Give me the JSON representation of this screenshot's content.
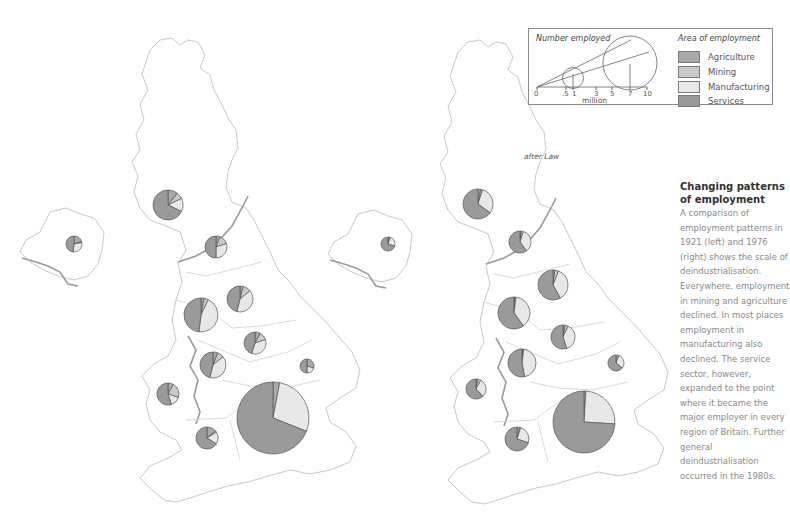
{
  "legend": {
    "number_title": "Number employed",
    "scale_ticks": [
      "0",
      ".5",
      "1",
      "3",
      "5",
      "7",
      "10"
    ],
    "scale_unit": "million",
    "area_title": "Area of employment",
    "items": [
      {
        "label": "Agriculture",
        "color": "#a9a9a9"
      },
      {
        "label": "Mining",
        "color": "#c9c9c9"
      },
      {
        "label": "Manufacturing",
        "color": "#e6e6e6"
      },
      {
        "label": "Services",
        "color": "#9a9a9a"
      }
    ]
  },
  "source_note": "after Law",
  "caption": {
    "title": "Changing patterns of employment",
    "body": "A comparison of employment patterns in 1921 (left) and 1976 (right) shows the scale of deindustrialisation. Everywhere, employment in mining and agriculture declined. In most places employment in manufacturing also declined. The service sector, however, expanded to the point where it became the major employer in every region of Britain. Further general deindustrialisation occurred in the 1980s."
  },
  "chart_data": [
    {
      "type": "pie",
      "title": "Employment by region, 1921",
      "categories": [
        "Agriculture",
        "Mining",
        "Manufacturing",
        "Services"
      ],
      "pies": [
        {
          "region": "Scotland",
          "cx": 168,
          "cy": 205,
          "r": 15,
          "values": [
            6,
            4,
            8,
            38
          ],
          "other_values_note": "services ~45%, manufacturing ~35%"
        },
        {
          "region": "Northern Ireland",
          "cx": 74,
          "cy": 244,
          "r": 8,
          "values": [
            20,
            2,
            30,
            48
          ]
        },
        {
          "region": "North",
          "cx": 216,
          "cy": 247,
          "r": 11,
          "values": [
            6,
            14,
            30,
            50
          ]
        },
        {
          "region": "North West",
          "cx": 201,
          "cy": 315,
          "r": 17,
          "values": [
            3,
            4,
            45,
            48
          ]
        },
        {
          "region": "Yorkshire & Humberside",
          "cx": 240,
          "cy": 299,
          "r": 13,
          "values": [
            4,
            10,
            40,
            46
          ]
        },
        {
          "region": "East Midlands",
          "cx": 255,
          "cy": 343,
          "r": 11,
          "values": [
            8,
            12,
            35,
            45
          ]
        },
        {
          "region": "West Midlands",
          "cx": 213,
          "cy": 365,
          "r": 13,
          "values": [
            6,
            8,
            40,
            46
          ]
        },
        {
          "region": "East Anglia",
          "cx": 307,
          "cy": 366,
          "r": 7,
          "values": [
            30,
            0,
            20,
            50
          ]
        },
        {
          "region": "Wales",
          "cx": 168,
          "cy": 394,
          "r": 11,
          "values": [
            8,
            22,
            15,
            55
          ]
        },
        {
          "region": "South West",
          "cx": 207,
          "cy": 438,
          "r": 11,
          "values": [
            14,
            2,
            18,
            66
          ]
        },
        {
          "region": "South East",
          "cx": 273,
          "cy": 418,
          "r": 36,
          "values": [
            3,
            0,
            28,
            69
          ]
        }
      ]
    },
    {
      "type": "pie",
      "title": "Employment by region, 1976",
      "categories": [
        "Agriculture",
        "Mining",
        "Manufacturing",
        "Services"
      ],
      "pies": [
        {
          "region": "Scotland",
          "cx": 478,
          "cy": 204,
          "r": 15,
          "values": [
            3,
            2,
            30,
            65
          ]
        },
        {
          "region": "Northern Ireland",
          "cx": 388,
          "cy": 244,
          "r": 7,
          "values": [
            4,
            1,
            25,
            70
          ]
        },
        {
          "region": "North",
          "cx": 520,
          "cy": 242,
          "r": 11,
          "values": [
            2,
            3,
            35,
            60
          ]
        },
        {
          "region": "North West",
          "cx": 514,
          "cy": 313,
          "r": 16,
          "values": [
            1,
            1,
            38,
            60
          ]
        },
        {
          "region": "Yorkshire & Humberside",
          "cx": 553,
          "cy": 285,
          "r": 15,
          "values": [
            2,
            4,
            36,
            58
          ]
        },
        {
          "region": "East Midlands",
          "cx": 563,
          "cy": 337,
          "r": 12,
          "values": [
            3,
            4,
            38,
            55
          ]
        },
        {
          "region": "West Midlands",
          "cx": 522,
          "cy": 363,
          "r": 14,
          "values": [
            1,
            1,
            45,
            53
          ]
        },
        {
          "region": "East Anglia",
          "cx": 616,
          "cy": 363,
          "r": 8,
          "values": [
            6,
            0,
            30,
            64
          ]
        },
        {
          "region": "Wales",
          "cx": 476,
          "cy": 389,
          "r": 10,
          "values": [
            3,
            5,
            30,
            62
          ]
        },
        {
          "region": "South West",
          "cx": 517,
          "cy": 439,
          "r": 12,
          "values": [
            4,
            1,
            25,
            70
          ]
        },
        {
          "region": "South East",
          "cx": 584,
          "cy": 422,
          "r": 31,
          "values": [
            1,
            0,
            25,
            74
          ]
        }
      ]
    }
  ]
}
